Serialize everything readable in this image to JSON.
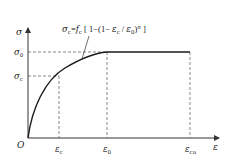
{
  "diagram": {
    "type": "stress-strain curve (parabola-rectangle)",
    "formula": {
      "lhs_sym": "σ",
      "lhs_sub": "c",
      "eq": "=",
      "f_sym": "f",
      "f_sub": "c",
      "open": " [ 1−(1− ",
      "eps_sym": "ε",
      "eps_sub": "c",
      "slash": " / ",
      "eps0_sym": "ε",
      "eps0_sub": "0",
      "close_paren": ")",
      "exp": "n",
      "close": " ]"
    },
    "axes": {
      "y_label": "σ",
      "x_label": "ε",
      "origin_label": "O"
    },
    "y_ticks": [
      {
        "sym": "σ",
        "sub": "0"
      },
      {
        "sym": "σ",
        "sub": "c"
      }
    ],
    "x_ticks": [
      {
        "sym": "ε",
        "sub": "c"
      },
      {
        "sym": "ε",
        "sub": "0"
      },
      {
        "sym": "ε",
        "sub": "cu"
      }
    ],
    "colors": {
      "curve": "#1a1a1a",
      "axis": "#333333",
      "dashed": "#555555",
      "background": "#ffffff"
    }
  }
}
